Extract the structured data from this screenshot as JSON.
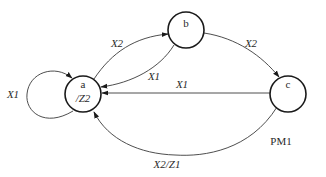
{
  "diagram": {
    "type": "state-machine",
    "caption": "PM1",
    "states": [
      {
        "id": "a",
        "name": "a",
        "output": "/Z2"
      },
      {
        "id": "b",
        "name": "b",
        "output": ""
      },
      {
        "id": "c",
        "name": "c",
        "output": ""
      }
    ],
    "transitions": [
      {
        "from": "a",
        "to": "a",
        "label": "X1"
      },
      {
        "from": "a",
        "to": "b",
        "label": "X2"
      },
      {
        "from": "b",
        "to": "a",
        "label": "X1"
      },
      {
        "from": "b",
        "to": "c",
        "label": "X2"
      },
      {
        "from": "c",
        "to": "a",
        "label": "X1"
      },
      {
        "from": "c",
        "to": "a",
        "label": "X2/Z1"
      }
    ],
    "colors": {
      "stroke": "#1a1a1a",
      "background": "#ffffff"
    }
  }
}
